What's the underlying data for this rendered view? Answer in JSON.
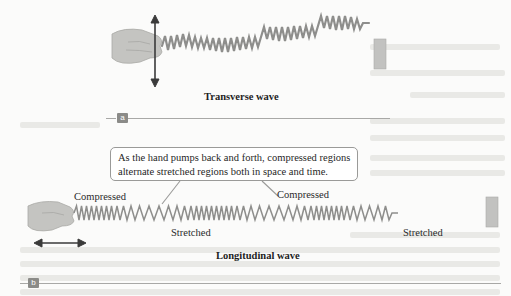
{
  "figure": {
    "panel_a": {
      "tag": "a",
      "caption": "Transverse wave",
      "elements": [
        "hand-icon",
        "double-arrow-vertical",
        "spring-coil-transverse",
        "wall-mount"
      ]
    },
    "panel_b": {
      "tag": "b",
      "caption": "Longitudinal wave",
      "callout_text": {
        "line1": "As the hand pumps back and forth, compressed regions",
        "line2": "alternate stretched regions both in space and time."
      },
      "labels": {
        "compressed_left": "Compressed",
        "compressed_right": "Compressed",
        "stretched_left": "Stretched",
        "stretched_right": "Stretched"
      },
      "elements": [
        "hand-icon",
        "double-arrow-horizontal",
        "spring-coil-longitudinal",
        "wall-mount"
      ]
    },
    "colors": {
      "spring": "#8e8e8c",
      "arrow": "#3a3a3a",
      "hand": "#b9b9b6",
      "wall": "#bdbdbb",
      "tag_bg": "#8b8b88",
      "rule": "#a8a8a6",
      "callout_border": "#9a9a98"
    }
  }
}
